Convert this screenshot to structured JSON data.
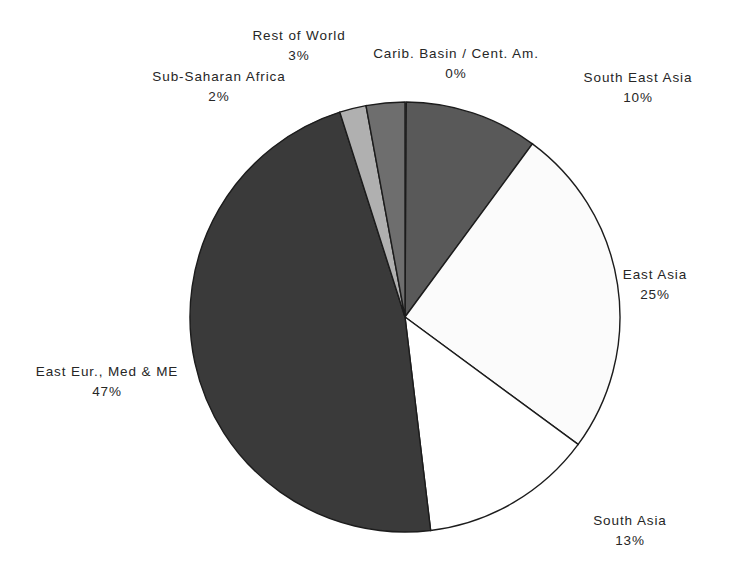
{
  "chart_data": {
    "type": "pie",
    "title": "",
    "subtitle": "",
    "xlabel": "",
    "ylabel": "",
    "legend_position": "none",
    "grid": false,
    "label_format": "name-above-percent",
    "start_angle_deg": 0,
    "direction": "clockwise",
    "center": {
      "x": 405,
      "y": 317,
      "radius": 215
    },
    "categories": [
      "Carib. Basin / Cent. Am.",
      "South East Asia",
      "East Asia",
      "South Asia",
      "East Eur., Med & ME",
      "Sub-Saharan Africa",
      "Rest of World"
    ],
    "values": [
      0,
      10,
      25,
      13,
      47,
      2,
      3
    ],
    "percent_labels": [
      "0%",
      "10%",
      "25%",
      "13%",
      "47%",
      "2%",
      "3%"
    ],
    "slices": [
      {
        "name": "Carib. Basin / Cent. Am.",
        "value": 0,
        "percent_label": "0%",
        "color": "#2e2e2e",
        "start_deg": 0.0,
        "end_deg": 0.35
      },
      {
        "name": "South East Asia",
        "value": 10,
        "percent_label": "10%",
        "color": "#595959",
        "start_deg": 0.35,
        "end_deg": 36.35
      },
      {
        "name": "East Asia",
        "value": 25,
        "percent_label": "25%",
        "color": "#fbfbfb",
        "start_deg": 36.35,
        "end_deg": 126.35
      },
      {
        "name": "South Asia",
        "value": 13,
        "percent_label": "13%",
        "color": "#ffffff",
        "start_deg": 126.35,
        "end_deg": 173.15
      },
      {
        "name": "East Eur., Med & ME",
        "value": 47,
        "percent_label": "47%",
        "color": "#3a3a3a",
        "start_deg": 173.15,
        "end_deg": 342.35
      },
      {
        "name": "Sub-Saharan Africa",
        "value": 2,
        "percent_label": "2%",
        "color": "#b0b0b0",
        "start_deg": 342.35,
        "end_deg": 349.55
      },
      {
        "name": "Rest of World",
        "value": 3,
        "percent_label": "3%",
        "color": "#6e6e6e",
        "start_deg": 349.55,
        "end_deg": 360.0
      }
    ],
    "stroke_color": "#1c1c1c",
    "background_color": "#ffffff"
  },
  "labels": {
    "rest_of_world": {
      "name": "Rest of World",
      "percent": "3%"
    },
    "carib_basin": {
      "name": "Carib. Basin / Cent. Am.",
      "percent": "0%"
    },
    "sub_saharan_africa": {
      "name": "Sub-Saharan Africa",
      "percent": "2%"
    },
    "south_east_asia": {
      "name": "South East Asia",
      "percent": "10%"
    },
    "east_asia": {
      "name": "East Asia",
      "percent": "25%"
    },
    "east_eur_med_me": {
      "name": "East Eur., Med & ME",
      "percent": "47%"
    },
    "south_asia": {
      "name": "South Asia",
      "percent": "13%"
    }
  }
}
